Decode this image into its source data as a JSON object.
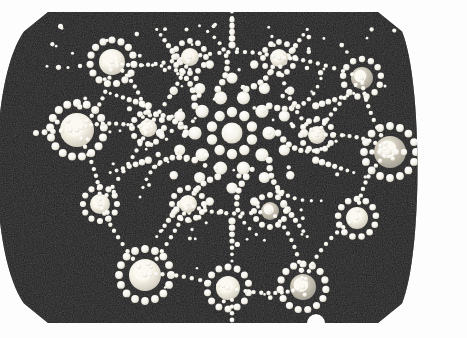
{
  "scene": {
    "title": "Dot Mandala Painted Stone",
    "subject": "dot-painted-stone",
    "medium": "acrylic dot art on dark stone",
    "background_color": "#fdfdfd",
    "image_width": 467,
    "image_height": 338
  },
  "stone": {
    "name": "painted-stone-body",
    "fill_color": "#141414",
    "texture_color": "#2a2a2a",
    "edge_highlight": "#3a3a3a",
    "shape": "rounded rectangle with flat top and bottom, curved left and right sides, beveled corners and a small semicircular notch at bottom center",
    "bounds": {
      "left": 22,
      "top": 12,
      "right": 404,
      "bottom": 323
    },
    "notch": {
      "cx": 316,
      "cy": 323,
      "r": 9
    }
  },
  "palette": {
    "dot_white": "#f6f5f0",
    "dot_cream": "#efeadc",
    "dot_gray": "#b9b6ad",
    "dot_shadow": "#8d8a82",
    "stone_dark": "#141414"
  },
  "mandala": {
    "center": {
      "x": 232,
      "y": 133
    },
    "arms": 10,
    "description": "central radial mandala of graduated dots with ten spokes and curved comma-shaped dot trails"
  },
  "rosettes": [
    {
      "id": "rosette-top-left",
      "cx": 112,
      "cy": 62,
      "core_r": 13,
      "core_fill": "#efeadc",
      "ring_r": 22,
      "ring_dots": 15,
      "ring_dot_r": 3.6
    },
    {
      "id": "rosette-top-mid",
      "cx": 190,
      "cy": 57,
      "core_r": 9,
      "core_fill": "#e8e2d2",
      "ring_r": 16,
      "ring_dots": 12,
      "ring_dot_r": 2.9
    },
    {
      "id": "rosette-top-right",
      "cx": 279,
      "cy": 58,
      "core_r": 9,
      "core_fill": "#e8e2d2",
      "ring_r": 16,
      "ring_dots": 12,
      "ring_dot_r": 2.9
    },
    {
      "id": "rosette-upper-right",
      "cx": 362,
      "cy": 78,
      "core_r": 11,
      "core_fill": "#cfcabb",
      "ring_r": 19,
      "ring_dots": 13,
      "ring_dot_r": 3.2
    },
    {
      "id": "rosette-left",
      "cx": 77,
      "cy": 130,
      "core_r": 17,
      "core_fill": "#f2eee2",
      "ring_r": 27,
      "ring_dots": 17,
      "ring_dot_r": 4.0
    },
    {
      "id": "rosette-inner-left",
      "cx": 148,
      "cy": 128,
      "core_r": 9,
      "core_fill": "#e4ded0",
      "ring_r": 16,
      "ring_dots": 12,
      "ring_dot_r": 3.0
    },
    {
      "id": "rosette-inner-right",
      "cx": 317,
      "cy": 135,
      "core_r": 9,
      "core_fill": "#ddd7c8",
      "ring_r": 16,
      "ring_dots": 12,
      "ring_dot_r": 3.0
    },
    {
      "id": "rosette-right",
      "cx": 390,
      "cy": 152,
      "core_r": 16,
      "core_fill": "#b9b4a5",
      "ring_r": 26,
      "ring_dots": 16,
      "ring_dot_r": 3.9
    },
    {
      "id": "rosette-mid-right",
      "cx": 320,
      "cy": 136,
      "core_r": 0,
      "core_fill": "#ddd7c8",
      "ring_r": 0,
      "ring_dots": 0,
      "ring_dot_r": 0
    },
    {
      "id": "rosette-lower-left",
      "cx": 100,
      "cy": 204,
      "core_r": 10,
      "core_fill": "#eae5d6",
      "ring_r": 17,
      "ring_dots": 12,
      "ring_dot_r": 3.1
    },
    {
      "id": "rosette-lower-mid-left",
      "cx": 188,
      "cy": 204,
      "core_r": 9,
      "core_fill": "#e3ddcd",
      "ring_r": 16,
      "ring_dots": 12,
      "ring_dot_r": 3.0
    },
    {
      "id": "rosette-lower-mid-right",
      "cx": 270,
      "cy": 211,
      "core_r": 9,
      "core_fill": "#cfc9ba",
      "ring_r": 16,
      "ring_dots": 12,
      "ring_dot_r": 3.0
    },
    {
      "id": "rosette-lower-right",
      "cx": 357,
      "cy": 218,
      "core_r": 11,
      "core_fill": "#ddd8c9",
      "ring_r": 19,
      "ring_dots": 13,
      "ring_dot_r": 3.3
    },
    {
      "id": "rosette-bottom-left",
      "cx": 145,
      "cy": 275,
      "core_r": 16,
      "core_fill": "#f1ede1",
      "ring_r": 26,
      "ring_dots": 16,
      "ring_dot_r": 3.9
    },
    {
      "id": "rosette-bottom-mid",
      "cx": 228,
      "cy": 288,
      "core_r": 12,
      "core_fill": "#f0ebdf",
      "ring_r": 21,
      "ring_dots": 14,
      "ring_dot_r": 3.5
    },
    {
      "id": "rosette-bottom-right",
      "cx": 303,
      "cy": 287,
      "core_r": 13,
      "core_fill": "#cbc5b5",
      "ring_r": 23,
      "ring_dots": 15,
      "ring_dot_r": 3.6
    }
  ],
  "chart_data": {
    "type": "scatter",
    "xlabel": "",
    "ylabel": "",
    "xlim": [
      0,
      467
    ],
    "ylim": [
      0,
      338
    ],
    "grid": false,
    "legend": "none",
    "series": [
      {
        "name": "rosette-centers",
        "x": [
          112,
          190,
          279,
          362,
          77,
          148,
          317,
          390,
          100,
          188,
          270,
          357,
          145,
          228,
          303
        ],
        "y": [
          62,
          57,
          58,
          78,
          130,
          128,
          135,
          152,
          204,
          204,
          211,
          218,
          275,
          288,
          287
        ],
        "sizes": [
          13,
          9,
          9,
          11,
          17,
          9,
          9,
          16,
          10,
          9,
          9,
          11,
          16,
          12,
          13
        ]
      },
      {
        "name": "mandala-center",
        "x": [
          232
        ],
        "y": [
          133
        ],
        "sizes": [
          11
        ]
      }
    ]
  }
}
